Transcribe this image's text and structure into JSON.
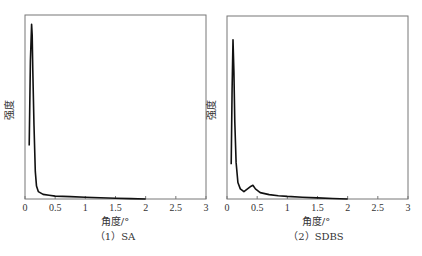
{
  "chart_data": [
    {
      "type": "line",
      "title": "",
      "caption": "（1）SA",
      "xlabel": "角度/°",
      "ylabel": "强度",
      "xlim": [
        0,
        3
      ],
      "ylim": [
        0,
        100
      ],
      "xticks": [
        "0",
        "0.5",
        "1",
        "1.5",
        "2",
        "2.5",
        "3"
      ],
      "yticks": [],
      "grid": false,
      "series": [
        {
          "name": "SA",
          "x": [
            0.07,
            0.09,
            0.11,
            0.12,
            0.13,
            0.15,
            0.17,
            0.19,
            0.22,
            0.3,
            0.4,
            0.5,
            0.75,
            1.0,
            1.25,
            1.5,
            1.75,
            2.0
          ],
          "y": [
            29,
            75,
            95,
            89,
            70,
            40,
            15,
            7,
            4,
            2.5,
            2.0,
            1.6,
            1.3,
            0.9,
            0.7,
            0.4,
            0.2,
            0.0
          ]
        }
      ]
    },
    {
      "type": "line",
      "title": "",
      "caption": "（2）SDBS",
      "xlabel": "角度/°",
      "ylabel": "强度",
      "xlim": [
        0,
        3
      ],
      "ylim": [
        0,
        100
      ],
      "xticks": [
        "0",
        "0.5",
        "1",
        "1.5",
        "2",
        "2.5",
        "3"
      ],
      "yticks": [],
      "grid": false,
      "series": [
        {
          "name": "SDBS",
          "x": [
            0.07,
            0.085,
            0.1,
            0.115,
            0.13,
            0.15,
            0.18,
            0.22,
            0.28,
            0.34,
            0.4,
            0.43,
            0.47,
            0.55,
            0.7,
            0.85,
            1.0,
            1.25,
            1.5,
            1.75,
            2.0
          ],
          "y": [
            19,
            60,
            87,
            70,
            42,
            20,
            9,
            5.5,
            4,
            5.5,
            7,
            7.5,
            5.5,
            3.5,
            2.4,
            1.8,
            1.4,
            1.0,
            0.6,
            0.3,
            0.0
          ]
        }
      ]
    }
  ]
}
